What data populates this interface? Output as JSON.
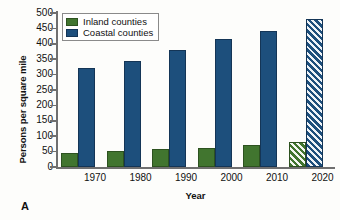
{
  "chart_data": {
    "type": "bar",
    "title": "",
    "xlabel": "Year",
    "ylabel": "Persons per square mile",
    "categories": [
      "1970",
      "1980",
      "1990",
      "2000",
      "2010",
      "2020"
    ],
    "series": [
      {
        "name": "Inland counties",
        "color": "#41752f",
        "values": [
          45,
          52,
          57,
          63,
          70,
          80
        ]
      },
      {
        "name": "Coastal counties",
        "color": "#1d4f7c",
        "values": [
          320,
          345,
          380,
          415,
          440,
          480
        ]
      }
    ],
    "projected_categories": [
      "2020"
    ],
    "ylim": [
      0,
      500
    ],
    "yticks": [
      0,
      50,
      100,
      150,
      200,
      250,
      300,
      350,
      400,
      450,
      500
    ],
    "grid": false,
    "legend_position": "top-left"
  },
  "panel_letter": "A"
}
